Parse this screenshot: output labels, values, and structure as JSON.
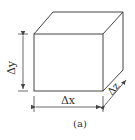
{
  "figure": {
    "caption": "(a)",
    "labels": {
      "dx": "Δx",
      "dy": "Δy",
      "dz": "Δz"
    },
    "colors": {
      "line": "#444444",
      "background": "#ffffff"
    }
  }
}
